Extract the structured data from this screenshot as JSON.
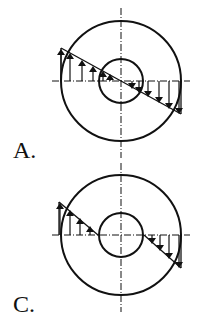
{
  "figures": [
    {
      "id": "A",
      "label": "A.",
      "description": "Stress distribution across full section: linear triangle spanning outer diameter through hollow center",
      "center": [
        121,
        81
      ],
      "outer_radius": 60,
      "inner_radius": 22,
      "stress_line": [
        [
          61,
          48
        ],
        [
          181,
          114
        ]
      ],
      "arrows_up_x": [
        61,
        70,
        82,
        93,
        103,
        110
      ],
      "arrows_down_x": [
        132,
        139,
        148,
        159,
        169,
        179
      ]
    },
    {
      "id": "C",
      "label": "C.",
      "description": "Stress distribution only on solid material (excluding hollow core)",
      "center": [
        121,
        235
      ],
      "outer_radius": 60,
      "inner_radius": 22,
      "stress_line_left": [
        [
          61,
          202
        ],
        [
          98,
          235
        ]
      ],
      "stress_line_right": [
        [
          144,
          235
        ],
        [
          181,
          268
        ]
      ],
      "arrows_up_x": [
        61,
        70,
        80,
        90
      ],
      "arrows_down_x": [
        152,
        160,
        169,
        179
      ]
    }
  ],
  "colors": {
    "stroke": "#111111",
    "background": "#ffffff"
  }
}
